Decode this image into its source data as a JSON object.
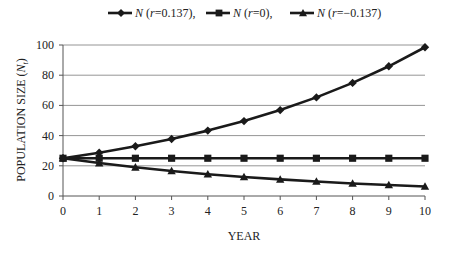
{
  "chart_data": {
    "type": "line",
    "title": "",
    "xlabel": "YEAR",
    "ylabel": "POPULATION SIZE (N_t)",
    "ylabel_main": "POPULATION SIZE (",
    "ylabel_var": "N",
    "ylabel_sub": "t",
    "ylabel_close": ")",
    "x": [
      0,
      1,
      2,
      3,
      4,
      5,
      6,
      7,
      8,
      9,
      10
    ],
    "xlim": [
      0,
      10
    ],
    "ylim": [
      0,
      100
    ],
    "x_ticks": [
      "0",
      "1",
      "2",
      "3",
      "4",
      "5",
      "6",
      "7",
      "8",
      "9",
      "10"
    ],
    "y_ticks": [
      "0",
      "20",
      "40",
      "60",
      "80",
      "100"
    ],
    "grid": "horizontal",
    "legend_position": "top",
    "series": [
      {
        "name": "N (r=0.137)",
        "legend_var": "N",
        "legend_paren": " (r=0.137),",
        "marker": "diamond",
        "values": [
          25,
          28.7,
          32.9,
          37.7,
          43.3,
          49.6,
          56.9,
          65.3,
          74.9,
          85.9,
          98.5
        ]
      },
      {
        "name": "N (r=0)",
        "legend_var": "N",
        "legend_paren": " (r=0),",
        "marker": "square",
        "values": [
          25,
          25,
          25,
          25,
          25,
          25,
          25,
          25,
          25,
          25,
          25
        ]
      },
      {
        "name": "N (r=-0.137)",
        "legend_var": "N",
        "legend_paren": " (r=−0.137)",
        "marker": "triangle",
        "values": [
          25,
          21.8,
          19.0,
          16.6,
          14.4,
          12.6,
          11.0,
          9.6,
          8.3,
          7.3,
          6.3
        ]
      }
    ],
    "colors": {
      "line": "#1a1a1a",
      "grid": "#7a7a7a",
      "axis": "#555555"
    }
  }
}
